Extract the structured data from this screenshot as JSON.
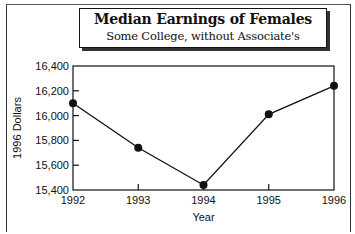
{
  "chart_data": {
    "type": "line",
    "title": "Median Earnings of Females",
    "subtitle": "Some College, without Associate's",
    "xlabel": "Year",
    "ylabel": "1996 Dollars",
    "x": [
      1992,
      1993,
      1994,
      1995,
      1996
    ],
    "x_tick_labels": [
      "1992",
      "1993",
      "1994",
      "1995",
      "1996"
    ],
    "series": [
      {
        "name": "Median Earnings",
        "values": [
          16100,
          15740,
          15440,
          16010,
          16240
        ],
        "marker": "circle",
        "color": "#111111"
      }
    ],
    "ylim": [
      15400,
      16400
    ],
    "y_ticks": [
      15400,
      15600,
      15800,
      16000,
      16200,
      16400
    ],
    "y_tick_labels": [
      "15,400",
      "15,600",
      "15,800",
      "16,000",
      "16,200",
      "16,400"
    ],
    "grid": false,
    "legend": "none"
  }
}
